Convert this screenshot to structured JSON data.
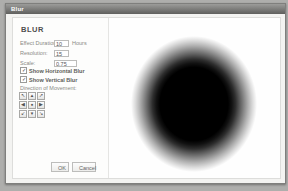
{
  "window": {
    "title": "Blur"
  },
  "header": {
    "title": "BLUR",
    "update_preview_label": "Update Preview"
  },
  "form": {
    "fields": [
      {
        "label": "Effect Duration:",
        "value": "10",
        "suffix": "Hours"
      },
      {
        "label": "Resolution:",
        "value": "15",
        "suffix": ""
      },
      {
        "label": "Scale:",
        "value": "0.75",
        "suffix": ""
      }
    ],
    "checkboxes": [
      {
        "label": "Show Horizontal Blur",
        "checked": true,
        "check_glyph": "✓"
      },
      {
        "label": "Show Vertical Blur",
        "checked": true,
        "check_glyph": "✓"
      }
    ],
    "direction": {
      "label": "Direction of Movement:",
      "arrows": [
        "↖",
        "▲",
        "↗",
        "◀",
        "●",
        "▶",
        "↙",
        "▼",
        "↘"
      ]
    }
  },
  "footer": {
    "ok_label": "OK",
    "cancel_label": "Cancel"
  },
  "preview": {
    "shape": "blurred-ellipse",
    "color": "#000000"
  },
  "colors": {
    "titlebar": "#6f6f6d",
    "panel": "#fdfdfc",
    "background": "#aeaeac"
  }
}
